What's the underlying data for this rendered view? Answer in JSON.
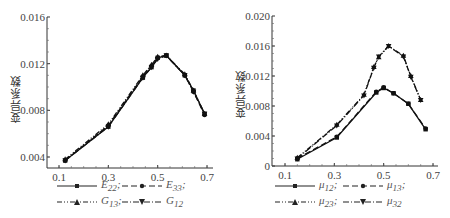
{
  "chart_data": [
    {
      "type": "line",
      "title": "",
      "xlabel": "",
      "ylabel": "变异系数",
      "xlim": [
        0.05,
        0.7
      ],
      "ylim": [
        0.003,
        0.016
      ],
      "xticks": [
        "0.1",
        "0.3",
        "0.5",
        "0.7"
      ],
      "yticks": [
        "0.004",
        "0.008",
        "0.012",
        "0.016"
      ],
      "legend_position": "bottom",
      "series": [
        {
          "name": "E22;",
          "style": "solid, square marker",
          "x": [
            0.125,
            0.3,
            0.44,
            0.475,
            0.5,
            0.535,
            0.61,
            0.645,
            0.69
          ],
          "y": [
            0.0037,
            0.0066,
            0.0108,
            0.0117,
            0.0125,
            0.0127,
            0.011,
            0.0097,
            0.0077
          ]
        },
        {
          "name": "E33;",
          "style": "dashed, circle marker",
          "x": [
            0.125,
            0.3,
            0.44,
            0.475,
            0.5,
            0.535,
            0.61,
            0.645,
            0.69
          ],
          "y": [
            0.0037,
            0.0067,
            0.0109,
            0.0118,
            0.0125,
            0.0127,
            0.011,
            0.0096,
            0.0076
          ]
        },
        {
          "name": "G13;",
          "style": "dash-dot-dot, triangle-up marker",
          "x": [
            0.125,
            0.3,
            0.44,
            0.475,
            0.5,
            0.535,
            0.61,
            0.645,
            0.69
          ],
          "y": [
            0.0038,
            0.0068,
            0.011,
            0.0119,
            0.0126,
            0.0127,
            0.0111,
            0.0097,
            0.0077
          ]
        },
        {
          "name": "G12",
          "style": "dash-dot, triangle-down marker",
          "x": [
            0.125,
            0.3,
            0.44,
            0.475,
            0.5,
            0.535,
            0.61,
            0.645,
            0.69
          ],
          "y": [
            0.0037,
            0.0066,
            0.0108,
            0.0117,
            0.0124,
            0.0127,
            0.011,
            0.0096,
            0.0077
          ]
        }
      ]
    },
    {
      "type": "line",
      "title": "",
      "xlabel": "",
      "ylabel": "变异系数",
      "xlim": [
        0.05,
        0.7
      ],
      "ylim": [
        0,
        0.02
      ],
      "xticks": [
        "0.1",
        "0.3",
        "0.5",
        "0.7"
      ],
      "yticks": [
        "0",
        "0.004",
        "0.008",
        "0.012",
        "0.016",
        "0.020"
      ],
      "legend_position": "bottom",
      "series": [
        {
          "name": "μ12;",
          "style": "solid, square marker",
          "x": [
            0.15,
            0.31,
            0.47,
            0.5,
            0.54,
            0.6,
            0.67
          ],
          "y": [
            0.0009,
            0.0038,
            0.0098,
            0.0104,
            0.0097,
            0.0083,
            0.0049
          ]
        },
        {
          "name": "μ13;",
          "style": "dashed, circle marker",
          "x": [
            0.15,
            0.31,
            0.47,
            0.5,
            0.54,
            0.6,
            0.67
          ],
          "y": [
            0.001,
            0.0039,
            0.0099,
            0.0105,
            0.0097,
            0.0083,
            0.005
          ]
        },
        {
          "name": "μ23;",
          "style": "dash-dot-dot, triangle-up marker",
          "x": [
            0.15,
            0.31,
            0.42,
            0.46,
            0.48,
            0.52,
            0.58,
            0.61,
            0.65
          ],
          "y": [
            0.0011,
            0.0055,
            0.0095,
            0.0132,
            0.0145,
            0.016,
            0.0147,
            0.012,
            0.0088
          ]
        },
        {
          "name": "μ32",
          "style": "dash-dot, triangle-down marker",
          "x": [
            0.15,
            0.31,
            0.42,
            0.46,
            0.48,
            0.52,
            0.58,
            0.61,
            0.65
          ],
          "y": [
            0.001,
            0.0054,
            0.0094,
            0.0131,
            0.0146,
            0.016,
            0.0146,
            0.0119,
            0.0088
          ]
        }
      ]
    }
  ],
  "left": {
    "ylabel": "变异系数",
    "yticks": [
      "0.016",
      "0.012",
      "0.008",
      "0.004"
    ],
    "xticks": [
      "0.1",
      "0.3",
      "0.5",
      "0.7"
    ],
    "legend": [
      {
        "base": "E",
        "sub": "22",
        "sep": ";"
      },
      {
        "base": "E",
        "sub": "33",
        "sep": ";"
      },
      {
        "base": "G",
        "sub": "13",
        "sep": ";"
      },
      {
        "base": "G",
        "sub": "12",
        "sep": ""
      }
    ]
  },
  "right": {
    "ylabel": "变异系数",
    "yticks": [
      "0.020",
      "0.016",
      "0.012",
      "0.008",
      "0.004",
      "0"
    ],
    "xticks": [
      "0.1",
      "0.3",
      "0.5",
      "0.7"
    ],
    "legend": [
      {
        "base": "μ",
        "sub": "12",
        "sep": ";"
      },
      {
        "base": "μ",
        "sub": "13",
        "sep": ";"
      },
      {
        "base": "μ",
        "sub": "23",
        "sep": ";"
      },
      {
        "base": "μ",
        "sub": "32",
        "sep": ""
      }
    ]
  }
}
